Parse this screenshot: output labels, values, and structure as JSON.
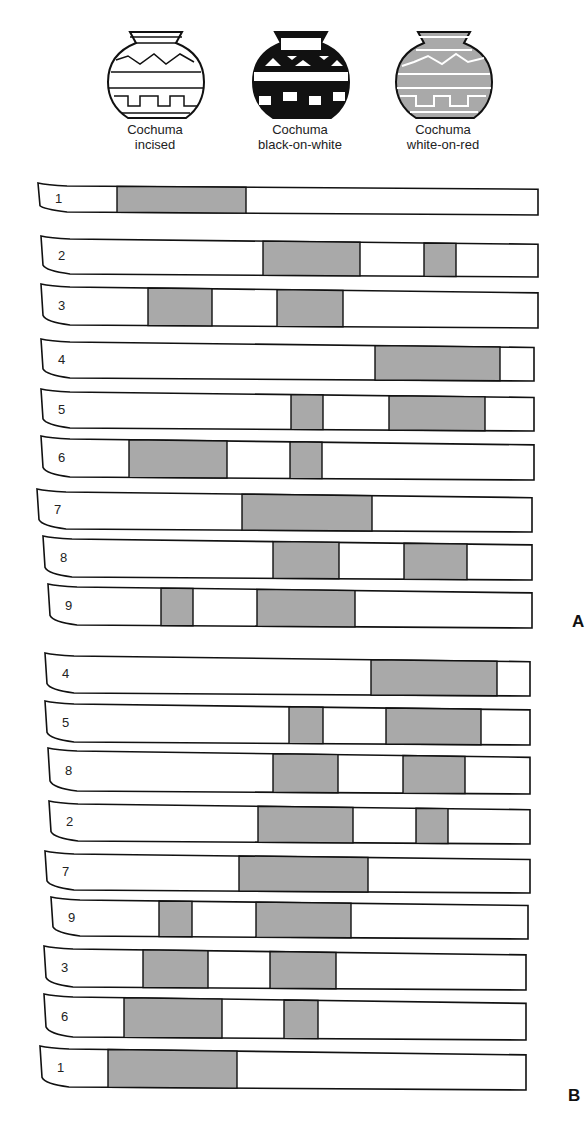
{
  "types": [
    {
      "id": "incised",
      "label_line1": "Cochuma",
      "label_line2": "incised",
      "style": "outline"
    },
    {
      "id": "bow",
      "label_line1": "Cochuma",
      "label_line2": "black-on-white",
      "style": "black"
    },
    {
      "id": "wor",
      "label_line1": "Cochuma",
      "label_line2": "white-on-red",
      "style": "gray"
    }
  ],
  "colors": {
    "shade": "#a9a9a9",
    "outline": "#111111",
    "paper": "#ffffff"
  },
  "frames": [
    {
      "label": "A",
      "label_pos": {
        "x": 572,
        "y": 612
      },
      "strips": [
        {
          "num": "1",
          "x1": 37,
          "x2": 538,
          "y1": 182,
          "y2": 215,
          "bars": [
            [
              117,
              246
            ]
          ]
        },
        {
          "num": "2",
          "x1": 40,
          "x2": 538,
          "y1": 235,
          "y2": 277,
          "bars": [
            [
              263,
              360
            ],
            [
              424,
              456
            ]
          ]
        },
        {
          "num": "3",
          "x1": 40,
          "x2": 538,
          "y1": 283,
          "y2": 328,
          "bars": [
            [
              148,
              212
            ],
            [
              277,
              343
            ]
          ]
        },
        {
          "num": "4",
          "x1": 40,
          "x2": 534,
          "y1": 338,
          "y2": 381,
          "bars": [
            [
              375,
              500
            ]
          ]
        },
        {
          "num": "5",
          "x1": 40,
          "x2": 534,
          "y1": 388,
          "y2": 431,
          "bars": [
            [
              291,
              323
            ],
            [
              389,
              485
            ]
          ]
        },
        {
          "num": "6",
          "x1": 40,
          "x2": 534,
          "y1": 435,
          "y2": 480,
          "bars": [
            [
              129,
              227
            ],
            [
              290,
              322
            ]
          ]
        },
        {
          "num": "7",
          "x1": 36,
          "x2": 532,
          "y1": 488,
          "y2": 532,
          "bars": [
            [
              242,
              372
            ]
          ]
        },
        {
          "num": "8",
          "x1": 42,
          "x2": 532,
          "y1": 535,
          "y2": 580,
          "bars": [
            [
              273,
              339
            ],
            [
              404,
              467
            ]
          ]
        },
        {
          "num": "9",
          "x1": 47,
          "x2": 532,
          "y1": 583,
          "y2": 628,
          "bars": [
            [
              161,
              193
            ],
            [
              257,
              355
            ]
          ]
        }
      ]
    },
    {
      "label": "B",
      "label_pos": {
        "x": 568,
        "y": 1086
      },
      "strips": [
        {
          "num": "4",
          "x1": 44,
          "x2": 530,
          "y1": 652,
          "y2": 696,
          "bars": [
            [
              371,
              497
            ]
          ]
        },
        {
          "num": "5",
          "x1": 44,
          "x2": 530,
          "y1": 700,
          "y2": 745,
          "bars": [
            [
              289,
              323
            ],
            [
              386,
              481
            ]
          ]
        },
        {
          "num": "8",
          "x1": 47,
          "x2": 530,
          "y1": 747,
          "y2": 794,
          "bars": [
            [
              273,
              338
            ],
            [
              403,
              465
            ]
          ]
        },
        {
          "num": "2",
          "x1": 48,
          "x2": 530,
          "y1": 800,
          "y2": 844,
          "bars": [
            [
              258,
              353
            ],
            [
              416,
              448
            ]
          ]
        },
        {
          "num": "7",
          "x1": 44,
          "x2": 530,
          "y1": 850,
          "y2": 893,
          "bars": [
            [
              239,
              368
            ]
          ]
        },
        {
          "num": "9",
          "x1": 50,
          "x2": 528,
          "y1": 896,
          "y2": 939,
          "bars": [
            [
              159,
              192
            ],
            [
              256,
              351
            ]
          ]
        },
        {
          "num": "3",
          "x1": 43,
          "x2": 526,
          "y1": 945,
          "y2": 990,
          "bars": [
            [
              143,
              208
            ],
            [
              270,
              336
            ]
          ]
        },
        {
          "num": "6",
          "x1": 43,
          "x2": 526,
          "y1": 993,
          "y2": 1040,
          "bars": [
            [
              124,
              222
            ],
            [
              284,
              318
            ]
          ]
        },
        {
          "num": "1",
          "x1": 39,
          "x2": 526,
          "y1": 1045,
          "y2": 1090,
          "bars": [
            [
              108,
              237
            ]
          ]
        }
      ]
    }
  ]
}
